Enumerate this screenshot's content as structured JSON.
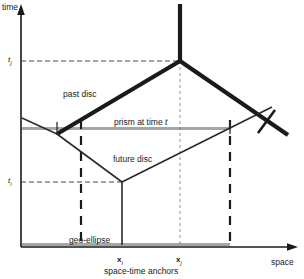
{
  "figure": {
    "axes": {
      "y_label": "time",
      "x_label": "space"
    },
    "ticks": {
      "t_j": "t",
      "t_j_sub": "j",
      "t_i": "t",
      "t_i_sub": "i"
    },
    "anchors": {
      "x_i": "x",
      "x_i_sub": "i",
      "x_j": "x",
      "x_j_sub": "j",
      "caption": "space-time anchors"
    },
    "annotations": {
      "past_disc": "past disc",
      "prism_prefix": "prism at time ",
      "prism_var": "t",
      "future_disc": "future disc",
      "geo_ellipse": "geo-ellipse"
    },
    "colors": {
      "ink": "#1a1a1a",
      "thick_line": "#1a1a1a",
      "thin_line": "#2b2b2b",
      "gray_line": "#a6a6a6",
      "dash": "#333333",
      "background": "#ffffff"
    }
  }
}
